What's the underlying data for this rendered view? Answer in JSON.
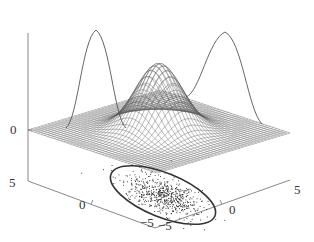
{
  "chart_data": {
    "type": "surface3d",
    "title": "",
    "surface": {
      "function": "bivariate_gaussian",
      "mean": [
        0,
        0
      ],
      "xlim": [
        -5,
        5
      ],
      "ylim": [
        -5,
        5
      ],
      "mesh": true
    },
    "marginals": [
      {
        "axis": "x",
        "shape": "gaussian",
        "wall": "back-left"
      },
      {
        "axis": "y",
        "shape": "gaussian",
        "wall": "back-right"
      }
    ],
    "floor": {
      "scatter": "samples",
      "ellipse": "covariance contour"
    },
    "axes": {
      "z": {
        "ticks": [
          "0"
        ]
      },
      "x": {
        "ticks": [
          "5",
          "0",
          "-5"
        ],
        "range": [
          -5,
          5
        ]
      },
      "y": {
        "ticks": [
          "-5",
          "0",
          "5"
        ],
        "range": [
          -5,
          5
        ]
      }
    },
    "xlabel": "",
    "ylabel": "",
    "zlabel": "",
    "grid": false,
    "legend": null
  },
  "ticks": {
    "z0": "0",
    "x5": "5",
    "x0": "0",
    "xm5": "−5",
    "ym5": "−5",
    "y0": "0",
    "y5": "5"
  },
  "colors": {
    "mesh": "#555555",
    "axis": "#777777",
    "curve": "#666666",
    "ellipse": "#333333",
    "points": "#222222"
  }
}
